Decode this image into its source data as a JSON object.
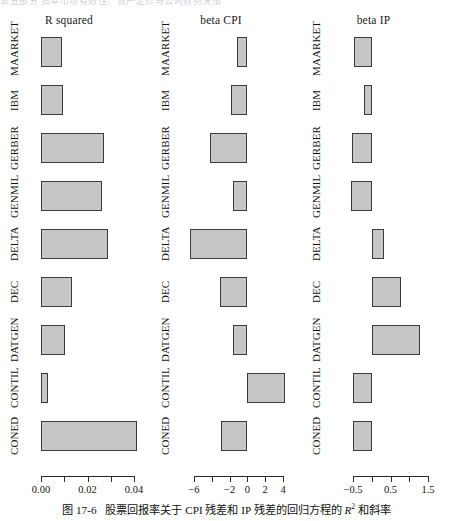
{
  "header_strip": "第五部分 资本市场有效性、资产定价与公司财务决策",
  "caption": {
    "number": "图 17-6",
    "text_before_r": "股票回报率关于 CPI 残差和 IP 残差的回归方程的 ",
    "r_symbol": "R",
    "r_exponent": "2",
    "text_after_r": " 和斜率"
  },
  "chart_data": {
    "type": "bar",
    "orientation": "horizontal",
    "grid": false,
    "legend": "none",
    "categories": [
      "MAARKET",
      "IBM",
      "GERBER",
      "GENMIL",
      "DELTA",
      "DEC",
      "DATGEN",
      "CONTIL",
      "CONED"
    ],
    "panels": [
      {
        "title": "R squared",
        "xlabel": "",
        "ylabel": "",
        "xlim": [
          0.0,
          0.0455
        ],
        "ticks": [
          0.0,
          0.01,
          0.02,
          0.03,
          0.04
        ],
        "tick_labels": [
          "0.00",
          "",
          "0.02",
          "",
          "0.04"
        ],
        "values": [
          0.009,
          0.0093,
          0.027,
          0.0262,
          0.029,
          0.0132,
          0.0104,
          0.003,
          0.0415
        ]
      },
      {
        "title": "beta CPI",
        "xlabel": "",
        "ylabel": "",
        "xlim": [
          -6.8,
          4.8
        ],
        "ticks": [
          -6,
          -4,
          -2,
          0,
          2,
          4
        ],
        "tick_labels": [
          "-6",
          "",
          "-2",
          "0",
          "2",
          "4"
        ],
        "values": [
          -1.2,
          -1.8,
          -4.2,
          -1.6,
          -6.4,
          -3.1,
          -1.6,
          4.2,
          -3.0
        ]
      },
      {
        "title": "beta IP",
        "xlabel": "",
        "ylabel": "",
        "xlim": [
          -0.56,
          1.62
        ],
        "ticks": [
          -0.5,
          0.0,
          0.5,
          1.0,
          1.5
        ],
        "tick_labels": [
          "-0.5",
          "",
          "0.5",
          "",
          "1.5"
        ],
        "values": [
          -0.48,
          -0.22,
          -0.54,
          -0.56,
          0.33,
          0.78,
          1.28,
          -0.5,
          -0.5
        ]
      }
    ]
  }
}
